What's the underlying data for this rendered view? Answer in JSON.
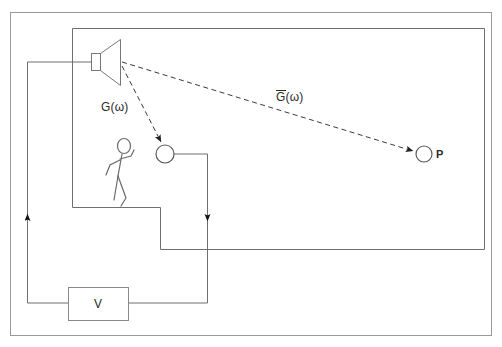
{
  "figure": {
    "type": "schematic-diagram",
    "title": "",
    "background_color": "#ffffff",
    "line_color": "#555555",
    "dashed_color": "#3a3a3a",
    "text_color": "#2b2b2b"
  },
  "labels": {
    "transfer_direct": "G(ω)",
    "transfer_bar_symbol": "G",
    "transfer_bar_args": "(ω)",
    "point_p": "P",
    "amplifier": "V"
  },
  "elements": {
    "outer_enclosure": "outer-boundary-rectangle",
    "inner_room": "inner-room-rectangle",
    "speaker": "loudspeaker-horn",
    "listener": "stick-figure-person",
    "microphone": "microphone-circle",
    "measurement_point": "measurement-point-circle",
    "amplifier_box": "amplifier-block-v",
    "direct_path_arrow": "dashed-arrow-speaker-to-microphone",
    "remote_path_arrow": "dashed-arrow-speaker-to-point-p",
    "feedback_wire_left": "wire-up-to-speaker",
    "feedback_wire_right": "wire-down-from-microphone"
  },
  "geometry": {
    "outer_rect": {
      "x": 10,
      "y": 12,
      "w": 482,
      "h": 324
    },
    "inner_room_top_left": {
      "x": 72,
      "y": 28
    },
    "inner_room_right": 484,
    "inner_room_bottom": 249,
    "speaker_mouth": {
      "x": 120,
      "y": 63
    },
    "microphone": {
      "cx": 165,
      "cy": 154,
      "r": 9
    },
    "point_p": {
      "cx": 424,
      "cy": 154,
      "r": 8
    },
    "amplifier_box": {
      "x": 68,
      "y": 287,
      "w": 60,
      "h": 33
    },
    "wire_left_x": 27,
    "wire_right_x": 207,
    "wire_bottom_y": 303,
    "arrow_up_y": 220,
    "arrow_down_y": 215
  }
}
